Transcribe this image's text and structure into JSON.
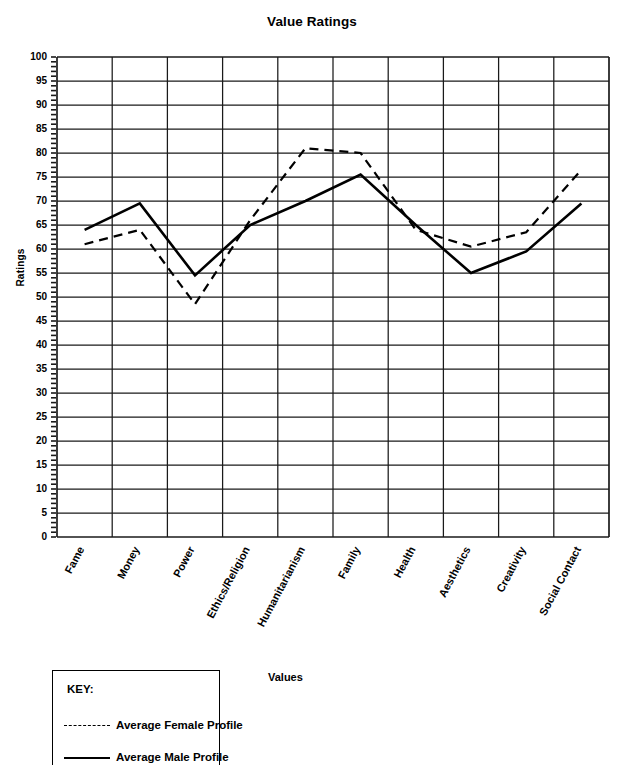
{
  "chart_data": {
    "type": "line",
    "title": "Value Ratings",
    "xlabel": "Values",
    "ylabel": "Ratings",
    "ylim": [
      0,
      100
    ],
    "ytick_step": 5,
    "minor_ticks": true,
    "grid": true,
    "legend_position": "below-left",
    "legend_title": "KEY:",
    "categories": [
      "Fame",
      "Money",
      "Power",
      "Ethics/Religion",
      "Humanitarianism",
      "Family",
      "Health",
      "Aesthetics",
      "Creativity",
      "Social Contact"
    ],
    "yticks": [
      0,
      5,
      10,
      15,
      20,
      25,
      30,
      35,
      40,
      45,
      50,
      55,
      60,
      65,
      70,
      75,
      80,
      85,
      90,
      95,
      100
    ],
    "series": [
      {
        "name": "Average Female Profile",
        "style": "dashed",
        "color": "#000000",
        "values": [
          61,
          64,
          48.5,
          66,
          81,
          80,
          64,
          60.5,
          63.5,
          76.5
        ]
      },
      {
        "name": "Average Male Profile",
        "style": "solid",
        "color": "#000000",
        "values": [
          64,
          69.5,
          54.5,
          65,
          70,
          75.5,
          65,
          55,
          59.5,
          69.5
        ]
      }
    ]
  },
  "legend": {
    "title": "KEY:",
    "entries": [
      {
        "label": "Average Female Profile",
        "style": "dashed"
      },
      {
        "label": "Average Male Profile",
        "style": "solid"
      }
    ]
  }
}
